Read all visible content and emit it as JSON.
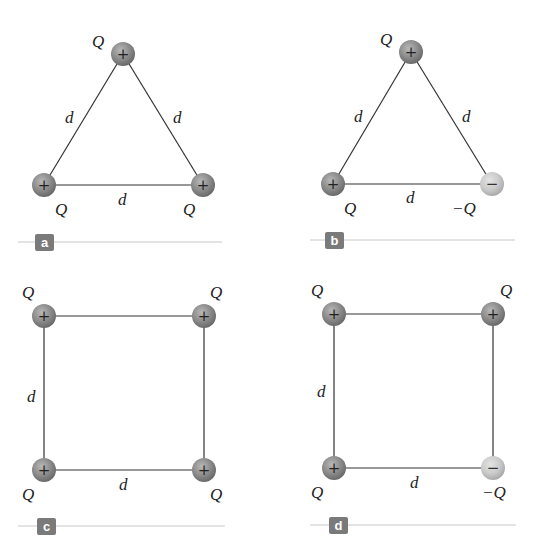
{
  "panels": [
    {
      "id": "a",
      "tag": "a",
      "shape": "triangle",
      "side_label": "d",
      "charges": [
        {
          "position": "top",
          "label": "Q",
          "sign": "+"
        },
        {
          "position": "bottom-left",
          "label": "Q",
          "sign": "+"
        },
        {
          "position": "bottom-right",
          "label": "Q",
          "sign": "+"
        }
      ],
      "side_labels": [
        "d",
        "d",
        "d"
      ]
    },
    {
      "id": "b",
      "tag": "b",
      "shape": "triangle",
      "charges": [
        {
          "position": "top",
          "label": "Q",
          "sign": "+"
        },
        {
          "position": "bottom-left",
          "label": "Q",
          "sign": "+"
        },
        {
          "position": "bottom-right",
          "label": "−Q",
          "sign": "−"
        }
      ],
      "side_labels": [
        "d",
        "d",
        "d"
      ]
    },
    {
      "id": "c",
      "tag": "c",
      "shape": "square",
      "charges": [
        {
          "position": "top-left",
          "label": "Q",
          "sign": "+"
        },
        {
          "position": "top-right",
          "label": "Q",
          "sign": "+"
        },
        {
          "position": "bottom-left",
          "label": "Q",
          "sign": "+"
        },
        {
          "position": "bottom-right",
          "label": "Q",
          "sign": "+"
        }
      ],
      "side_labels": [
        "d",
        "d"
      ]
    },
    {
      "id": "d",
      "tag": "d",
      "shape": "square",
      "charges": [
        {
          "position": "top-left",
          "label": "Q",
          "sign": "+"
        },
        {
          "position": "top-right",
          "label": "Q",
          "sign": "+"
        },
        {
          "position": "bottom-left",
          "label": "Q",
          "sign": "+"
        },
        {
          "position": "bottom-right",
          "label": "−Q",
          "sign": "−"
        }
      ],
      "side_labels": [
        "d",
        "d"
      ]
    }
  ],
  "colors": {
    "positive_charge": "#8a8a8a",
    "negative_charge": "#c8c8c8",
    "tag_bg": "#7a7a7a",
    "rule": "#c8c8c8",
    "line": "#333333"
  }
}
